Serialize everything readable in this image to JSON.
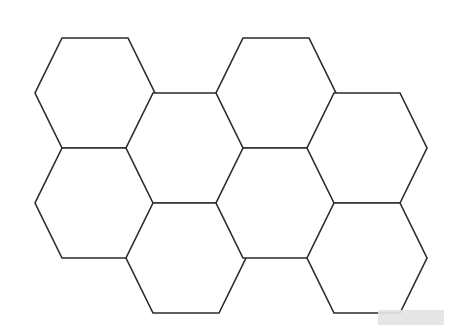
{
  "figure": {
    "background_color": "#ffffff",
    "stroke_color": "#2b2b2b",
    "fill_color": "#ffffff",
    "stroke_width": 1.6,
    "canvas": {
      "width": 450,
      "height": 328
    }
  },
  "geometry": {
    "hex_orientation": "flat-top",
    "half_width": 60,
    "half_height": 55,
    "top_edge_half_width": 33,
    "column_pitch_x": 90.5,
    "row_pitch_y": 110,
    "column_offset_y": 55
  },
  "hexagons": [
    {
      "id": "hex-a1",
      "label": "column-A-row-1",
      "cx": 95,
      "cy": 93
    },
    {
      "id": "hex-a2",
      "label": "column-A-row-2",
      "cx": 95,
      "cy": 203
    },
    {
      "id": "hex-b1",
      "label": "column-B-row-1",
      "cx": 186,
      "cy": 148
    },
    {
      "id": "hex-b2",
      "label": "column-B-row-2",
      "cx": 186,
      "cy": 258
    },
    {
      "id": "hex-c1",
      "label": "column-C-row-1",
      "cx": 276,
      "cy": 93
    },
    {
      "id": "hex-c2",
      "label": "column-C-row-2",
      "cx": 276,
      "cy": 203
    },
    {
      "id": "hex-d1",
      "label": "column-D-row-1",
      "cx": 367,
      "cy": 148
    },
    {
      "id": "hex-d2",
      "label": "column-D-row-2",
      "cx": 367,
      "cy": 258
    }
  ],
  "watermark": {
    "text": "",
    "box_color": "#e4e4e4",
    "left": 378,
    "top": 310,
    "width": 66,
    "height": 15
  }
}
